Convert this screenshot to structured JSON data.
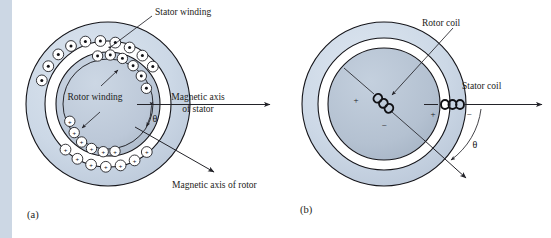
{
  "figure": {
    "background_color": "#ffffff",
    "edge_strip_color": "#ccd7e4",
    "ink_color": "#1c1c20"
  },
  "colors": {
    "stator_fill": "#ccd8e6",
    "rotor_fill": "#b9c5d4",
    "airgap_fill": "#ffffff",
    "slot_fill": "#ffffff",
    "outline": "#15151a",
    "text": "#1c1c20"
  },
  "panels": [
    {
      "id": "a",
      "label": "(a)",
      "caption_labels": {
        "stator_winding": "Stator winding",
        "rotor_winding": "Rotor winding",
        "magnetic_axis_of_stator_line1": "Magnetic axis",
        "magnetic_axis_of_stator_line2": "of stator",
        "magnetic_axis_of_rotor": "Magnetic axis of rotor",
        "angle": "θ"
      },
      "geometry": {
        "center_x": 108,
        "center_y": 104,
        "stator_outer_radius": 82,
        "stator_inner_radius": 63,
        "rotor_outer_radius": 52,
        "rotor_body_radius": 45
      },
      "conductor_symbols": {
        "dot": "⊙",
        "cross": "+",
        "dot_count": 15,
        "cross_count": 15
      }
    },
    {
      "id": "b",
      "label": "(b)",
      "caption_labels": {
        "rotor_coil": "Rotor coil",
        "stator_coil": "Stator coil",
        "angle": "θ",
        "rotor_plus": "+",
        "rotor_minus": "−",
        "stator_plus": "+",
        "stator_minus": "−"
      },
      "geometry": {
        "center_x": 384,
        "center_y": 104,
        "stator_outer_radius": 82,
        "stator_inner_radius": 66,
        "rotor_outer_radius": 56
      }
    }
  ]
}
